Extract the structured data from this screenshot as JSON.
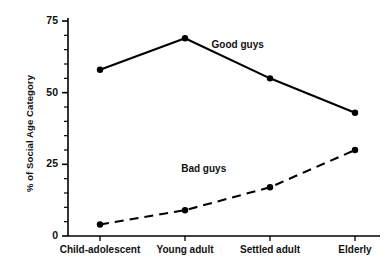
{
  "chart_data": {
    "type": "line",
    "title": "",
    "xlabel": "",
    "ylabel": "% of Social Age Category",
    "categories": [
      "Child-adolescent",
      "Young adult",
      "Settled adult",
      "Elderly"
    ],
    "ylim": [
      0,
      75
    ],
    "yticks": [
      0,
      25,
      50,
      75
    ],
    "ytick_labels": [
      "0",
      "25",
      "50",
      "75"
    ],
    "minor_tick_step": 5,
    "grid": false,
    "legend": "inline-annotations",
    "series": [
      {
        "name": "Good guys",
        "values": [
          58,
          69,
          55,
          43
        ],
        "style": "solid",
        "color": "#000000",
        "marker": "filled-circle",
        "label_x_category_fraction": 1.62,
        "label_value": 63
      },
      {
        "name": "Bad guys",
        "values": [
          4,
          9,
          17,
          30
        ],
        "style": "dashed",
        "color": "#000000",
        "marker": "filled-circle",
        "label_x_category_fraction": 1.22,
        "label_value": 20
      }
    ],
    "annotations": [
      {
        "text": "Good guys",
        "series": "Good guys"
      },
      {
        "text": "Bad guys",
        "series": "Bad guys"
      }
    ]
  },
  "axes": {
    "y_title": "% of Social Age Category",
    "y_tick_0": "0",
    "y_tick_25": "25",
    "y_tick_50": "50",
    "y_tick_75": "75",
    "x_cat_0": "Child-adolescent",
    "x_cat_1": "Young adult",
    "x_cat_2": "Settled adult",
    "x_cat_3": "Elderly"
  },
  "labels": {
    "good_guys": "Good guys",
    "bad_guys": "Bad guys"
  },
  "colors": {
    "ink": "#000000",
    "background": "#ffffff"
  }
}
